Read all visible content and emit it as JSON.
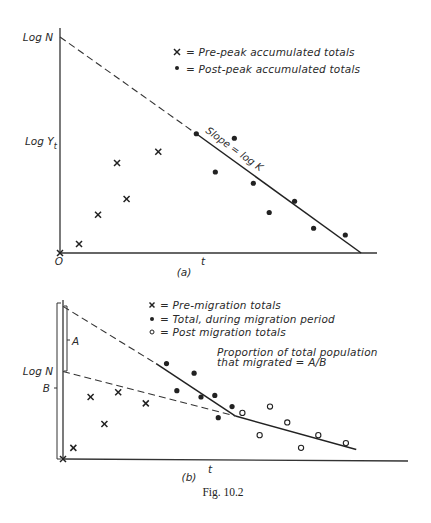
{
  "figure": {
    "caption": "Fig. 10.2"
  },
  "panel_a": {
    "tag": "(a)",
    "y_label_top": "Log N",
    "y_label_mid": "Log Y",
    "y_label_mid_sub": "t",
    "x_label": "t",
    "origin_label": "O",
    "slope_label": "Slope = log K",
    "legend": [
      {
        "symbol": "x",
        "text": "= Pre-peak accumulated totals"
      },
      {
        "symbol": "dot",
        "text": "= Post-peak accumulated totals"
      }
    ]
  },
  "panel_b": {
    "tag": "(b)",
    "y_label": "Log N",
    "bracket_a_label": "A",
    "bracket_b_label": "B",
    "x_label": "t",
    "legend": [
      {
        "symbol": "x",
        "text": "= Pre-migration totals"
      },
      {
        "symbol": "dot",
        "text": "= Total, during migration period"
      },
      {
        "symbol": "circle",
        "text": "= Post migration totals"
      }
    ],
    "annotation_line1": "Proportion of total population",
    "annotation_line2": "that migrated = A/B"
  },
  "chart_data": [
    {
      "type": "scatter",
      "title": "(a)",
      "xlabel": "t",
      "ylabel": "Log Y_t",
      "xlim": [
        0,
        100
      ],
      "ylim": [
        0,
        100
      ],
      "grid": false,
      "legend_position": "upper right",
      "note": "No numeric ticks shown; values are relative positions within axis extent (0-100).",
      "series": [
        {
          "name": "Pre-peak accumulated totals",
          "marker": "x",
          "points": [
            [
              0,
              0
            ],
            [
              6,
              4
            ],
            [
              12,
              17
            ],
            [
              21,
              24
            ],
            [
              18,
              40
            ],
            [
              31,
              45
            ]
          ]
        },
        {
          "name": "Post-peak accumulated totals",
          "marker": "dot",
          "points": [
            [
              43,
              53
            ],
            [
              55,
              51
            ],
            [
              49,
              36
            ],
            [
              61,
              31
            ],
            [
              74,
              23
            ],
            [
              66,
              18
            ],
            [
              80,
              11
            ],
            [
              90,
              8
            ]
          ]
        }
      ],
      "lines": [
        {
          "name": "extrapolation to Log N",
          "style": "dashed",
          "points": [
            [
              0,
              96
            ],
            [
              43,
              53
            ]
          ]
        },
        {
          "name": "Slope = log K",
          "style": "solid",
          "points": [
            [
              43,
              53
            ],
            [
              95,
              0
            ]
          ]
        }
      ],
      "annotations": [
        "Log N",
        "Slope = log K",
        "O"
      ]
    },
    {
      "type": "scatter",
      "title": "(b)",
      "xlabel": "t",
      "ylabel": "Log N",
      "xlim": [
        0,
        100
      ],
      "ylim": [
        0,
        100
      ],
      "grid": false,
      "legend_position": "upper right",
      "note": "No numeric ticks shown; values are relative positions within axis extent (0-100).",
      "series": [
        {
          "name": "Pre-migration totals",
          "marker": "x",
          "points": [
            [
              0,
              0
            ],
            [
              3,
              7
            ],
            [
              12,
              22
            ],
            [
              8,
              39
            ],
            [
              16,
              42
            ],
            [
              24,
              35
            ]
          ]
        },
        {
          "name": "Total, during migration period",
          "marker": "dot",
          "points": [
            [
              30,
              60
            ],
            [
              38,
              54
            ],
            [
              33,
              43
            ],
            [
              40,
              39
            ],
            [
              44,
              40
            ],
            [
              49,
              33
            ],
            [
              45,
              26
            ]
          ]
        },
        {
          "name": "Post migration totals",
          "marker": "circle",
          "points": [
            [
              52,
              29
            ],
            [
              60,
              33
            ],
            [
              65,
              23
            ],
            [
              57,
              15
            ],
            [
              74,
              15
            ],
            [
              69,
              7
            ],
            [
              82,
              10
            ]
          ]
        }
      ],
      "lines": [
        {
          "name": "upper extrapolation",
          "style": "dashed",
          "points": [
            [
              0,
              96
            ],
            [
              27,
              60
            ]
          ]
        },
        {
          "name": "migration period fit",
          "style": "solid",
          "points": [
            [
              27,
              60
            ],
            [
              50,
              27
            ]
          ]
        },
        {
          "name": "post migration fit",
          "style": "solid",
          "points": [
            [
              50,
              27
            ],
            [
              85,
              6
            ]
          ]
        },
        {
          "name": "lower extrapolation",
          "style": "dashed",
          "points": [
            [
              0,
              55
            ],
            [
              50,
              27
            ]
          ]
        }
      ],
      "brackets": [
        {
          "label": "A",
          "from": 55,
          "to": 96
        },
        {
          "label": "B",
          "from": 0,
          "to": 96
        }
      ],
      "annotations": [
        "Proportion of total population that migrated = A/B"
      ]
    }
  ]
}
